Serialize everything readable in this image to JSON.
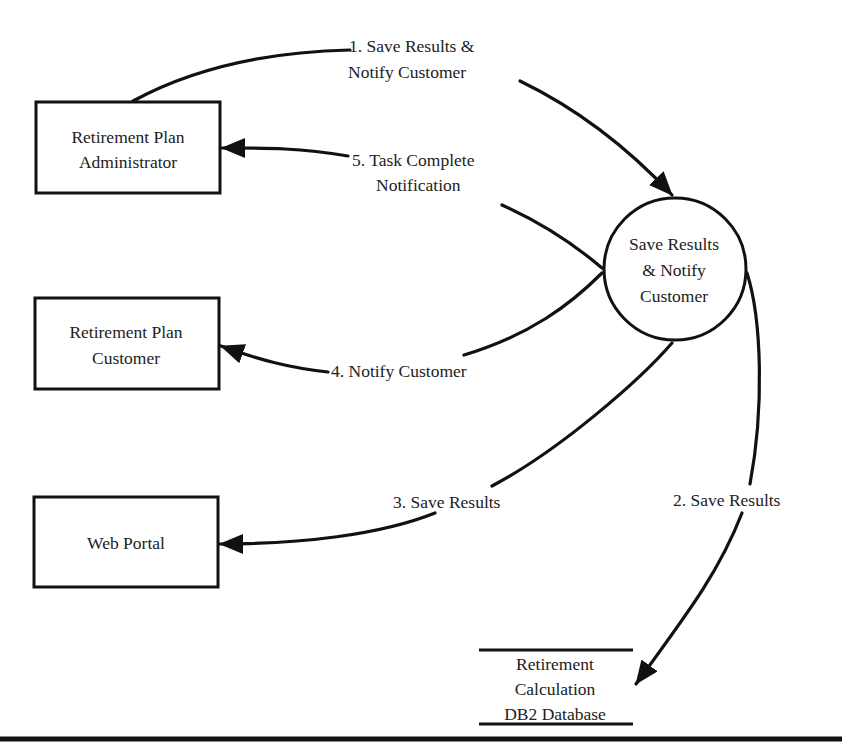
{
  "diagram": {
    "type": "data-flow-diagram",
    "process": {
      "label_lines": [
        "Save Results",
        "& Notify",
        "Customer"
      ]
    },
    "entities": [
      {
        "id": "admin",
        "label_lines": [
          "Retirement Plan",
          "Administrator"
        ]
      },
      {
        "id": "customer",
        "label_lines": [
          "Retirement Plan",
          "Customer"
        ]
      },
      {
        "id": "portal",
        "label_lines": [
          "Web Portal"
        ]
      }
    ],
    "datastore": {
      "label_lines": [
        "Retirement",
        "Calculation",
        "DB2 Database"
      ]
    },
    "flows": [
      {
        "num": "1",
        "label_lines": [
          "1. Save Results &",
          "Notify Customer"
        ],
        "from": "admin",
        "to": "process"
      },
      {
        "num": "2",
        "label_lines": [
          "2. Save Results"
        ],
        "from": "process",
        "to": "datastore"
      },
      {
        "num": "3",
        "label_lines": [
          "3. Save Results"
        ],
        "from": "process",
        "to": "portal"
      },
      {
        "num": "4",
        "label_lines": [
          "4. Notify Customer"
        ],
        "from": "process",
        "to": "customer"
      },
      {
        "num": "5",
        "label_lines": [
          "5. Task Complete",
          "Notification"
        ],
        "from": "process",
        "to": "admin"
      }
    ],
    "colors": {
      "stroke": "#111111",
      "text": "#222222",
      "background": "#ffffff"
    }
  }
}
